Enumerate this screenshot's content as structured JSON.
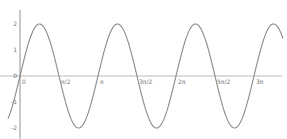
{
  "chart_data": {
    "type": "line",
    "title": "",
    "xlabel": "",
    "ylabel": "",
    "function": "y = 2 sin(2x)",
    "series": [
      {
        "name": "2sin(2x)",
        "color": "#8a8a8a"
      }
    ],
    "x_ticks": [
      "0",
      "π/2",
      "π",
      "3π/2",
      "2π",
      "5π/2",
      "3π"
    ],
    "x_tick_values": [
      0,
      1.5708,
      3.1416,
      4.7124,
      6.2832,
      7.854,
      9.4248
    ],
    "y_ticks": [
      "2",
      "1",
      "0",
      "-1",
      "-2"
    ],
    "y_tick_values": [
      2,
      1,
      0,
      -1,
      -2
    ],
    "xlim": [
      -0.35,
      10.0
    ],
    "ylim": [
      -2.5,
      2.5
    ],
    "grid": false,
    "legend": "none",
    "sample_points": {
      "x": [
        0,
        0.7854,
        1.5708,
        2.3562,
        3.1416,
        3.927,
        4.7124,
        5.4978,
        6.2832,
        7.0686,
        7.854,
        8.6394,
        9.4248
      ],
      "y": [
        0,
        2,
        0,
        -2,
        0,
        2,
        0,
        -2,
        0,
        2,
        0,
        -2,
        0
      ]
    },
    "colors": {
      "curve": "#8a8a8a",
      "y_axis": "#777777",
      "x_axis": "#bbbbbb",
      "labels": "#777777"
    }
  }
}
